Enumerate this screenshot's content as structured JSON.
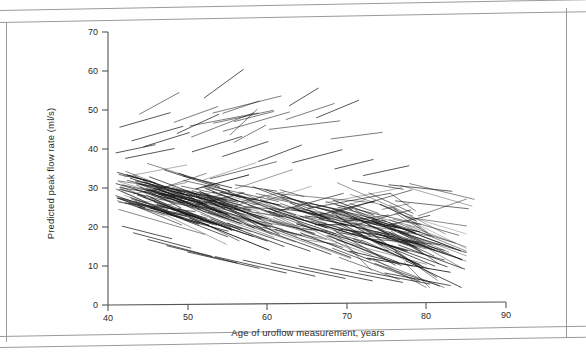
{
  "figure": {
    "kind": "scatter-spaghetti-plot",
    "background": "#ffffff",
    "ink_color": "#1a1a1a",
    "frame_color": "#9a9a9a"
  },
  "axes": {
    "x_title": "Age of uroflow measurement, years",
    "y_title": "Predicted peak flow rate (ml/s)",
    "x_ticks": [
      "40",
      "50",
      "60",
      "70",
      "80",
      "90"
    ],
    "y_ticks": [
      "0",
      "10",
      "20",
      "30",
      "40",
      "50",
      "60",
      "70"
    ]
  },
  "chart_data": {
    "type": "line",
    "title": "",
    "xlabel": "Age of uroflow measurement, years",
    "ylabel": "Predicted peak flow rate (ml/s)",
    "xlim": [
      40,
      90
    ],
    "ylim": [
      0,
      70
    ],
    "xticks": [
      40,
      50,
      60,
      70,
      80,
      90
    ],
    "yticks": [
      0,
      10,
      20,
      30,
      40,
      50,
      60,
      70
    ],
    "grid": false,
    "legend": "none",
    "series": [
      {
        "name": "s1",
        "x": [
          41.5,
          47.8
        ],
        "y": [
          45.6,
          49.3
        ]
      },
      {
        "name": "s2",
        "x": [
          52.1,
          57.0
        ],
        "y": [
          53.1,
          60.4
        ]
      },
      {
        "name": "s3",
        "x": [
          62.8,
          66.4
        ],
        "y": [
          51.1,
          55.6
        ]
      },
      {
        "name": "s4",
        "x": [
          66.2,
          71.5
        ],
        "y": [
          48.0,
          52.5
        ]
      },
      {
        "name": "s5",
        "x": [
          43.0,
          49.4
        ],
        "y": [
          42.1,
          45.8
        ]
      },
      {
        "name": "s6",
        "x": [
          48.7,
          53.9
        ],
        "y": [
          44.0,
          48.9
        ]
      },
      {
        "name": "s7",
        "x": [
          44.5,
          50.2
        ],
        "y": [
          40.6,
          44.2
        ]
      },
      {
        "name": "s8",
        "x": [
          41.0,
          45.9
        ],
        "y": [
          39.0,
          41.1
        ]
      },
      {
        "name": "s9",
        "x": [
          42.2,
          48.3
        ],
        "y": [
          37.6,
          40.1
        ]
      },
      {
        "name": "s10",
        "x": [
          50.6,
          56.8
        ],
        "y": [
          39.3,
          43.2
        ]
      },
      {
        "name": "s11",
        "x": [
          54.4,
          60.1
        ],
        "y": [
          38.1,
          41.9
        ]
      },
      {
        "name": "s12",
        "x": [
          58.9,
          64.3
        ],
        "y": [
          36.8,
          41.0
        ]
      },
      {
        "name": "s13",
        "x": [
          63.2,
          69.4
        ],
        "y": [
          36.5,
          39.8
        ]
      },
      {
        "name": "s14",
        "x": [
          68.5,
          73.3
        ],
        "y": [
          34.9,
          37.3
        ]
      },
      {
        "name": "s15",
        "x": [
          72.1,
          77.8
        ],
        "y": [
          33.2,
          35.7
        ]
      },
      {
        "name": "s16",
        "x": [
          41.2,
          46.0
        ],
        "y": [
          34.0,
          31.2
        ]
      },
      {
        "name": "s17",
        "x": [
          42.8,
          50.1
        ],
        "y": [
          32.5,
          28.0
        ]
      },
      {
        "name": "s18",
        "x": [
          44.0,
          52.6
        ],
        "y": [
          31.0,
          25.5
        ]
      },
      {
        "name": "s19",
        "x": [
          45.5,
          54.0
        ],
        "y": [
          29.4,
          23.8
        ]
      },
      {
        "name": "s20",
        "x": [
          41.0,
          49.2
        ],
        "y": [
          28.0,
          22.4
        ]
      },
      {
        "name": "s21",
        "x": [
          43.4,
          51.5
        ],
        "y": [
          26.6,
          21.0
        ]
      },
      {
        "name": "s22",
        "x": [
          46.2,
          55.8
        ],
        "y": [
          25.8,
          19.2
        ]
      },
      {
        "name": "s23",
        "x": [
          48.0,
          58.2
        ],
        "y": [
          24.5,
          17.6
        ]
      },
      {
        "name": "s24",
        "x": [
          50.4,
          60.0
        ],
        "y": [
          23.0,
          16.4
        ]
      },
      {
        "name": "s25",
        "x": [
          52.9,
          62.1
        ],
        "y": [
          22.1,
          15.0
        ]
      },
      {
        "name": "s26",
        "x": [
          55.0,
          65.4
        ],
        "y": [
          21.0,
          13.8
        ]
      },
      {
        "name": "s27",
        "x": [
          58.3,
          68.0
        ],
        "y": [
          20.2,
          13.0
        ]
      },
      {
        "name": "s28",
        "x": [
          61.0,
          70.5
        ],
        "y": [
          19.4,
          12.2
        ]
      },
      {
        "name": "s29",
        "x": [
          64.2,
          73.0
        ],
        "y": [
          18.5,
          11.5
        ]
      },
      {
        "name": "s30",
        "x": [
          67.5,
          76.4
        ],
        "y": [
          17.8,
          11.0
        ]
      },
      {
        "name": "s31",
        "x": [
          70.8,
          79.2
        ],
        "y": [
          17.0,
          10.4
        ]
      },
      {
        "name": "s32",
        "x": [
          74.0,
          82.6
        ],
        "y": [
          16.2,
          9.8
        ]
      },
      {
        "name": "s33",
        "x": [
          76.5,
          84.8
        ],
        "y": [
          15.4,
          9.2
        ]
      },
      {
        "name": "s34",
        "x": [
          41.8,
          48.0
        ],
        "y": [
          20.2,
          17.0
        ]
      },
      {
        "name": "s35",
        "x": [
          43.2,
          50.4
        ],
        "y": [
          18.5,
          14.6
        ]
      },
      {
        "name": "s36",
        "x": [
          45.0,
          53.0
        ],
        "y": [
          16.8,
          12.5
        ]
      },
      {
        "name": "s37",
        "x": [
          47.4,
          56.2
        ],
        "y": [
          15.2,
          10.8
        ]
      },
      {
        "name": "s38",
        "x": [
          50.0,
          59.0
        ],
        "y": [
          13.6,
          9.4
        ]
      },
      {
        "name": "s39",
        "x": [
          53.5,
          62.4
        ],
        "y": [
          12.4,
          8.2
        ]
      },
      {
        "name": "s40",
        "x": [
          57.0,
          66.0
        ],
        "y": [
          11.5,
          7.4
        ]
      },
      {
        "name": "s41",
        "x": [
          60.5,
          69.8
        ],
        "y": [
          10.8,
          6.8
        ]
      },
      {
        "name": "s42",
        "x": [
          64.0,
          73.2
        ],
        "y": [
          10.0,
          6.2
        ]
      },
      {
        "name": "s43",
        "x": [
          68.0,
          77.0
        ],
        "y": [
          9.4,
          5.8
        ]
      },
      {
        "name": "s44",
        "x": [
          71.5,
          80.4
        ],
        "y": [
          8.8,
          5.4
        ]
      },
      {
        "name": "s45",
        "x": [
          74.8,
          83.0
        ],
        "y": [
          8.2,
          5.0
        ]
      }
    ],
    "core_band": {
      "age_range": [
        41,
        85
      ],
      "peak_flow_range": [
        5,
        36
      ],
      "n_trajectories_approx": 250
    }
  }
}
